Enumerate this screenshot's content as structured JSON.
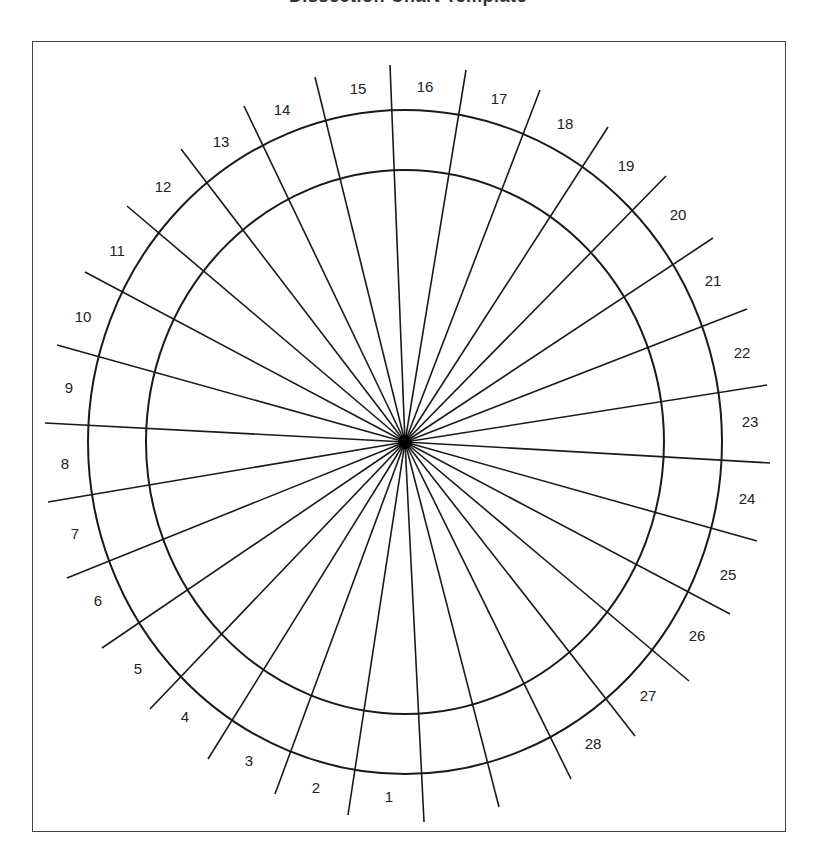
{
  "title": "Dissection Chart Template",
  "diagram": {
    "center": [
      405,
      442
    ],
    "outer_ring": {
      "rx": 317,
      "ry": 332
    },
    "inner_ring": {
      "rx": 259,
      "ry": 272
    },
    "line_color": "#1a1a1a",
    "ray_endpoints": [
      [
        390,
        65
      ],
      [
        466,
        70
      ],
      [
        540,
        90
      ],
      [
        608,
        127
      ],
      [
        666,
        176
      ],
      [
        713,
        238
      ],
      [
        747,
        309
      ],
      [
        767,
        385
      ],
      [
        770,
        463
      ],
      [
        757,
        541
      ],
      [
        730,
        614
      ],
      [
        689,
        681
      ],
      [
        635,
        736
      ],
      [
        571,
        779
      ],
      [
        499,
        807
      ],
      [
        424,
        822
      ],
      [
        348,
        815
      ],
      [
        275,
        794
      ],
      [
        208,
        759
      ],
      [
        150,
        709
      ],
      [
        102,
        648
      ],
      [
        67,
        578
      ],
      [
        48,
        502
      ],
      [
        45,
        423
      ],
      [
        57,
        345
      ],
      [
        85,
        272
      ],
      [
        127,
        206
      ],
      [
        181,
        149
      ],
      [
        244,
        106
      ],
      [
        315,
        77
      ]
    ],
    "sector_labels": [
      {
        "text": "1",
        "x": 389,
        "y": 798
      },
      {
        "text": "2",
        "x": 316,
        "y": 789
      },
      {
        "text": "3",
        "x": 249,
        "y": 762
      },
      {
        "text": "4",
        "x": 185,
        "y": 718
      },
      {
        "text": "5",
        "x": 138,
        "y": 670
      },
      {
        "text": "6",
        "x": 98,
        "y": 602
      },
      {
        "text": "7",
        "x": 75,
        "y": 535
      },
      {
        "text": "8",
        "x": 65,
        "y": 465
      },
      {
        "text": "9",
        "x": 69,
        "y": 389
      },
      {
        "text": "10",
        "x": 83,
        "y": 318
      },
      {
        "text": "11",
        "x": 117,
        "y": 252
      },
      {
        "text": "12",
        "x": 163,
        "y": 188
      },
      {
        "text": "13",
        "x": 221,
        "y": 143
      },
      {
        "text": "14",
        "x": 282,
        "y": 111
      },
      {
        "text": "15",
        "x": 358,
        "y": 90
      },
      {
        "text": "16",
        "x": 425,
        "y": 88
      },
      {
        "text": "17",
        "x": 499,
        "y": 100
      },
      {
        "text": "18",
        "x": 565,
        "y": 125
      },
      {
        "text": "19",
        "x": 626,
        "y": 167
      },
      {
        "text": "20",
        "x": 678,
        "y": 216
      },
      {
        "text": "21",
        "x": 713,
        "y": 282
      },
      {
        "text": "22",
        "x": 742,
        "y": 354
      },
      {
        "text": "23",
        "x": 750,
        "y": 423
      },
      {
        "text": "24",
        "x": 747,
        "y": 500
      },
      {
        "text": "25",
        "x": 728,
        "y": 576
      },
      {
        "text": "26",
        "x": 697,
        "y": 637
      },
      {
        "text": "27",
        "x": 648,
        "y": 697
      },
      {
        "text": "28",
        "x": 593,
        "y": 745
      }
    ]
  }
}
